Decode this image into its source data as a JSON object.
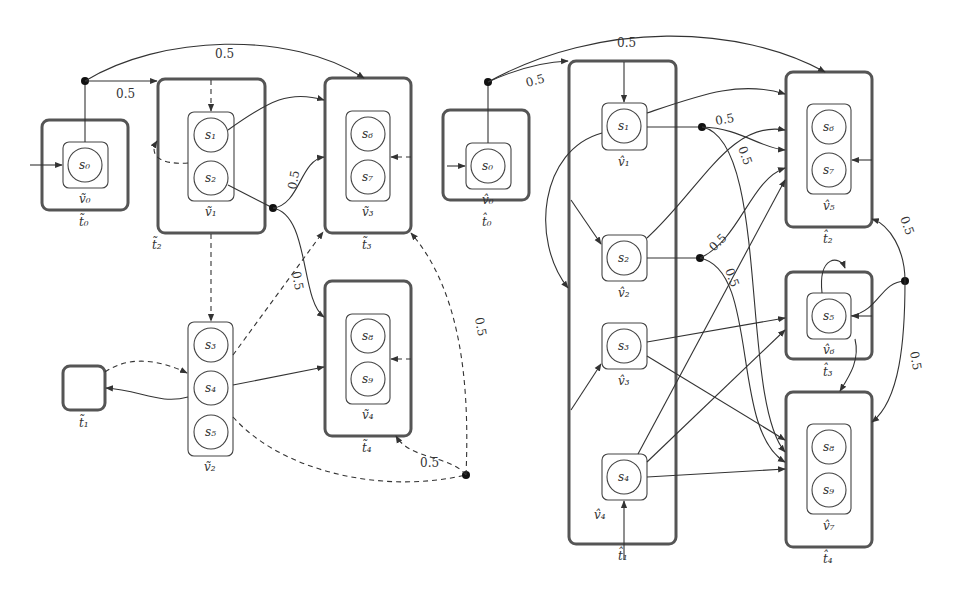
{
  "left_graph": {
    "tiles": [
      {
        "id": "t0",
        "label": "t̃₀",
        "x": 42,
        "y": 120,
        "w": 86,
        "h": 90
      },
      {
        "id": "t1",
        "label": "t̃₁",
        "x": 63,
        "y": 366,
        "w": 42,
        "h": 44
      },
      {
        "id": "t2",
        "label": "t̃₂",
        "x": 158,
        "y": 79,
        "w": 107,
        "h": 154
      },
      {
        "id": "t3",
        "label": "t̃₃",
        "x": 325,
        "y": 78,
        "w": 86,
        "h": 155
      },
      {
        "id": "t4",
        "label": "t̃₄",
        "x": 325,
        "y": 281,
        "w": 86,
        "h": 155
      }
    ],
    "vertices": [
      {
        "id": "v0",
        "label": "ṽ₀",
        "states": [
          "s0"
        ]
      },
      {
        "id": "v1",
        "label": "ṽ₁",
        "states": [
          "s1",
          "s2"
        ]
      },
      {
        "id": "v2",
        "label": "ṽ₂",
        "states": [
          "s3",
          "s4",
          "s5"
        ]
      },
      {
        "id": "v3",
        "label": "ṽ₃",
        "states": [
          "s6",
          "s7"
        ]
      },
      {
        "id": "v4",
        "label": "ṽ₄",
        "states": [
          "s8",
          "s9"
        ]
      }
    ],
    "probabilities": [
      "0.5",
      "0.5",
      "0.5",
      "0.5",
      "0.5",
      "0.5"
    ]
  },
  "right_graph": {
    "tiles": [
      {
        "id": "t0",
        "label": "t̂₀",
        "x": 443,
        "y": 110,
        "w": 86,
        "h": 90
      },
      {
        "id": "t1",
        "label": "t̂₁",
        "x": 569,
        "y": 61,
        "w": 107,
        "h": 483
      },
      {
        "id": "t2",
        "label": "t̂₂",
        "x": 786,
        "y": 72,
        "w": 86,
        "h": 155
      },
      {
        "id": "t3",
        "label": "t̂₃",
        "x": 786,
        "y": 272,
        "w": 86,
        "h": 87
      },
      {
        "id": "t4",
        "label": "t̂₄",
        "x": 786,
        "y": 392,
        "w": 86,
        "h": 155
      }
    ],
    "vertices": [
      {
        "id": "v0",
        "label": "v̂₀",
        "states": [
          "s0"
        ]
      },
      {
        "id": "v1",
        "label": "v̂₁",
        "states": [
          "s1"
        ]
      },
      {
        "id": "v2",
        "label": "v̂₂",
        "states": [
          "s2"
        ]
      },
      {
        "id": "v3",
        "label": "v̂₃",
        "states": [
          "s3"
        ]
      },
      {
        "id": "v4",
        "label": "v̂₄",
        "states": [
          "s4"
        ]
      },
      {
        "id": "v5",
        "label": "v̂₅",
        "states": [
          "s6",
          "s7"
        ]
      },
      {
        "id": "v6",
        "label": "v̂₆",
        "states": [
          "s5"
        ]
      },
      {
        "id": "v7",
        "label": "v̂₇",
        "states": [
          "s8",
          "s9"
        ]
      }
    ],
    "probabilities": [
      "0.5",
      "0.5",
      "0.5",
      "0.5",
      "0.5",
      "0.5",
      "0.5",
      "0.5"
    ]
  },
  "labels": {
    "p": "0.5",
    "s0": "s₀",
    "s1": "s₁",
    "s2": "s₂",
    "s3": "s₃",
    "s4": "s₄",
    "s5": "s₅",
    "s6": "s₆",
    "s7": "s₇",
    "s8": "s₈",
    "s9": "s₉",
    "lt0": "t̃₀",
    "lt1": "t̃₁",
    "lt2": "t̃₂",
    "lt3": "t̃₃",
    "lt4": "t̃₄",
    "lv0": "ṽ₀",
    "lv1": "ṽ₁",
    "lv2": "ṽ₂",
    "lv3": "ṽ₃",
    "lv4": "ṽ₄",
    "rt0": "t̂₀",
    "rt1": "t̂₁",
    "rt2": "t̂₂",
    "rt3": "t̂₃",
    "rt4": "t̂₄",
    "rv0": "v̂₀",
    "rv1": "v̂₁",
    "rv2": "v̂₂",
    "rv3": "v̂₃",
    "rv4": "v̂₄",
    "rv5": "v̂₅",
    "rv6": "v̂₆",
    "rv7": "v̂₇"
  }
}
